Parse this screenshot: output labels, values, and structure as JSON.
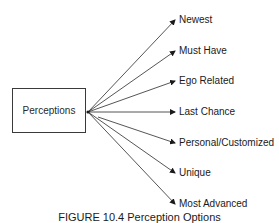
{
  "diagram": {
    "source": {
      "label": "Perceptions"
    },
    "targets": [
      {
        "label": "Newest",
        "y": 20
      },
      {
        "label": "Must Have",
        "y": 51
      },
      {
        "label": "Ego Related",
        "y": 81
      },
      {
        "label": "Last Chance",
        "y": 112
      },
      {
        "label": "Personal/Customized",
        "y": 143
      },
      {
        "label": "Unique",
        "y": 173
      },
      {
        "label": "Most Advanced",
        "y": 204
      }
    ],
    "caption": "FIGURE 10.4 Perception Options",
    "colors": {
      "line": "#2a2a2a",
      "text": "#1a1a1a",
      "background": "#ffffff"
    }
  }
}
